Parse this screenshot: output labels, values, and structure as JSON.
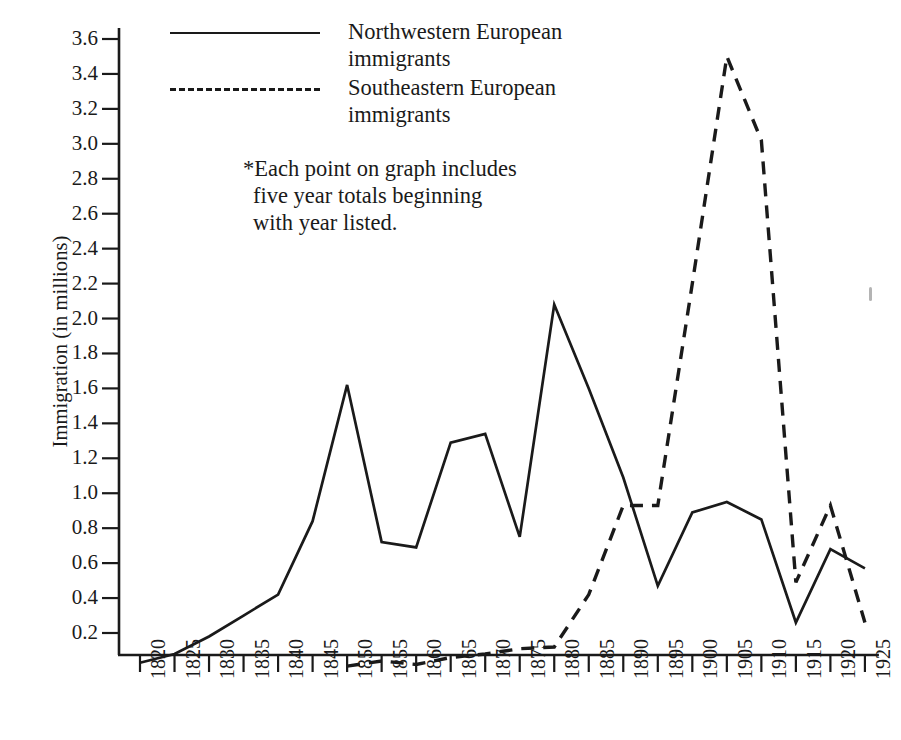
{
  "axes": {
    "y_title": "Immigration (in millions)",
    "y_ticks": [
      "3.6",
      "3.4",
      "3.2",
      "3.0",
      "2.8",
      "2.6",
      "2.4",
      "2.2",
      "2.0",
      "1.8",
      "1.6",
      "1.4",
      "1.2",
      "1.0",
      "0.8",
      "0.6",
      "0.4",
      "0.2"
    ],
    "x_ticks": [
      "1820",
      "1825",
      "1830",
      "1835",
      "1840",
      "1845",
      "1850",
      "1855",
      "1860",
      "1865",
      "1870",
      "1875",
      "1880",
      "1885",
      "1890",
      "1895",
      "1900",
      "1905",
      "1910",
      "1915",
      "1920",
      "1925"
    ]
  },
  "legend": {
    "items": [
      {
        "label": "Northwestern European immigrants",
        "style": "solid"
      },
      {
        "label": "Southeastern European immigrants",
        "style": "dashed"
      }
    ]
  },
  "note": {
    "line1": "*Each point on graph includes",
    "line2": "five year totals beginning",
    "line3": "with year listed."
  },
  "colors": {
    "line": "#1a1a1a",
    "axis": "#1a1a1a",
    "background": "#ffffff"
  },
  "chart_data": {
    "type": "line",
    "title": "",
    "xlabel": "",
    "ylabel": "Immigration (in millions)",
    "xlim": [
      1820,
      1925
    ],
    "ylim": [
      0,
      3.7
    ],
    "ytick_step": 0.2,
    "grid": false,
    "legend_position": "top-center",
    "annotation": "*Each point on graph includes five year totals beginning with year listed.",
    "x": [
      1820,
      1825,
      1830,
      1835,
      1840,
      1845,
      1850,
      1855,
      1860,
      1865,
      1870,
      1875,
      1880,
      1885,
      1890,
      1895,
      1900,
      1905,
      1910,
      1915,
      1920,
      1925
    ],
    "series": [
      {
        "name": "Northwestern European immigrants",
        "style": "solid",
        "values": [
          0.03,
          0.08,
          0.18,
          0.3,
          0.42,
          0.84,
          1.62,
          0.72,
          0.69,
          1.29,
          1.34,
          0.75,
          2.08,
          1.6,
          1.09,
          0.47,
          0.89,
          0.95,
          0.85,
          0.26,
          0.68,
          0.57
        ]
      },
      {
        "name": "Southeastern European immigrants",
        "style": "dashed",
        "values": [
          null,
          null,
          null,
          null,
          null,
          null,
          0.01,
          0.04,
          0.02,
          0.06,
          0.08,
          0.11,
          0.12,
          0.42,
          0.93,
          0.93,
          2.2,
          3.5,
          3.02,
          0.49,
          0.93,
          0.26
        ]
      }
    ]
  }
}
